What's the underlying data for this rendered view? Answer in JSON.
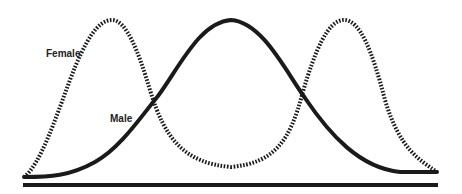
{
  "diagram": {
    "labels": {
      "female": "Female",
      "male": "Male"
    },
    "colors": {
      "line": "#1a1a1a",
      "background": "#ffffff"
    },
    "series": [
      {
        "name": "Female",
        "style": "dotted",
        "shape": "bimodal",
        "peaks_x": [
          112,
          344
        ],
        "valley_x": 231
      },
      {
        "name": "Male",
        "style": "solid",
        "shape": "unimodal",
        "peak_x": 231
      }
    ]
  }
}
